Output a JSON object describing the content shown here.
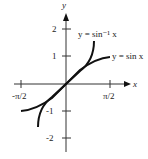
{
  "diagram": {
    "axes": {
      "x_label": "x",
      "y_label": "y"
    },
    "x_ticks": [
      "-π/2",
      "π/2"
    ],
    "y_ticks": [
      "2",
      "1",
      "-1",
      "-2"
    ],
    "curves": [
      {
        "name": "arcsin",
        "label": "y = sin⁻¹ x"
      },
      {
        "name": "sin",
        "label": "y = sin x"
      }
    ]
  }
}
